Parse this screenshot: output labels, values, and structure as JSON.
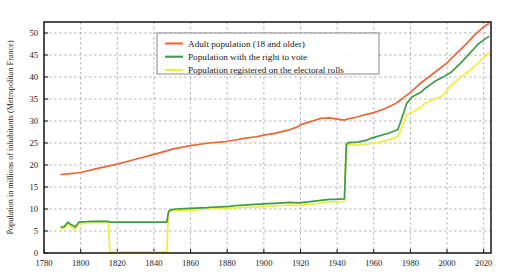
{
  "chart_data": {
    "type": "line",
    "title": "",
    "xlabel": "",
    "ylabel": "Population in millions of inhabitants (Metropolitan France)",
    "xlim": [
      1780,
      2024
    ],
    "ylim": [
      0,
      52.5
    ],
    "xticks": [
      1780,
      1800,
      1820,
      1840,
      1860,
      1880,
      1900,
      1920,
      1940,
      1960,
      1980,
      2000,
      2020
    ],
    "yticks": [
      0,
      5,
      10,
      15,
      20,
      25,
      30,
      35,
      40,
      45,
      50
    ],
    "grid": true,
    "legend_position": "upper-left-inside",
    "series": [
      {
        "name": "Adult population (18 and older)",
        "color": "#E8683A",
        "points": [
          [
            1789,
            17.8
          ],
          [
            1800,
            18.3
          ],
          [
            1810,
            19.3
          ],
          [
            1820,
            20.2
          ],
          [
            1830,
            21.3
          ],
          [
            1840,
            22.4
          ],
          [
            1846,
            23.1
          ],
          [
            1850,
            23.6
          ],
          [
            1860,
            24.4
          ],
          [
            1870,
            25.0
          ],
          [
            1876,
            25.2
          ],
          [
            1880,
            25.4
          ],
          [
            1886,
            25.8
          ],
          [
            1890,
            26.1
          ],
          [
            1896,
            26.4
          ],
          [
            1900,
            26.8
          ],
          [
            1906,
            27.2
          ],
          [
            1911,
            27.7
          ],
          [
            1914,
            28.0
          ],
          [
            1918,
            28.6
          ],
          [
            1921,
            29.3
          ],
          [
            1926,
            29.9
          ],
          [
            1931,
            30.6
          ],
          [
            1936,
            30.7
          ],
          [
            1939,
            30.5
          ],
          [
            1944,
            30.2
          ],
          [
            1946,
            30.5
          ],
          [
            1950,
            30.8
          ],
          [
            1954,
            31.3
          ],
          [
            1960,
            31.9
          ],
          [
            1965,
            32.6
          ],
          [
            1968,
            33.2
          ],
          [
            1972,
            34.0
          ],
          [
            1975,
            34.9
          ],
          [
            1980,
            36.5
          ],
          [
            1985,
            38.4
          ],
          [
            1990,
            40.0
          ],
          [
            1995,
            41.6
          ],
          [
            2000,
            43.2
          ],
          [
            2005,
            45.3
          ],
          [
            2010,
            47.3
          ],
          [
            2015,
            49.5
          ],
          [
            2020,
            51.4
          ],
          [
            2023,
            52.2
          ]
        ]
      },
      {
        "name": "Population with the right to vote",
        "color": "#3E9B46",
        "points": [
          [
            1789,
            5.8
          ],
          [
            1791,
            6.0
          ],
          [
            1793,
            7.0
          ],
          [
            1795,
            6.4
          ],
          [
            1797,
            5.9
          ],
          [
            1799,
            7.0
          ],
          [
            1802,
            7.1
          ],
          [
            1806,
            7.2
          ],
          [
            1810,
            7.2
          ],
          [
            1814,
            7.2
          ],
          [
            1815,
            7.2
          ],
          [
            1816,
            7.0
          ],
          [
            1820,
            7.0
          ],
          [
            1824,
            7.0
          ],
          [
            1830,
            7.0
          ],
          [
            1831,
            7.0
          ],
          [
            1840,
            7.0
          ],
          [
            1846,
            7.0
          ],
          [
            1847,
            7.0
          ],
          [
            1848,
            9.4
          ],
          [
            1849,
            9.8
          ],
          [
            1852,
            10.0
          ],
          [
            1857,
            10.1
          ],
          [
            1863,
            10.2
          ],
          [
            1869,
            10.3
          ],
          [
            1871,
            10.4
          ],
          [
            1876,
            10.5
          ],
          [
            1881,
            10.6
          ],
          [
            1885,
            10.8
          ],
          [
            1889,
            10.9
          ],
          [
            1893,
            11.0
          ],
          [
            1898,
            11.1
          ],
          [
            1902,
            11.2
          ],
          [
            1906,
            11.3
          ],
          [
            1910,
            11.4
          ],
          [
            1914,
            11.5
          ],
          [
            1919,
            11.4
          ],
          [
            1924,
            11.6
          ],
          [
            1928,
            11.8
          ],
          [
            1932,
            12.0
          ],
          [
            1936,
            12.2
          ],
          [
            1939,
            12.2
          ],
          [
            1944,
            12.3
          ],
          [
            1945,
            24.6
          ],
          [
            1946,
            25.1
          ],
          [
            1951,
            25.2
          ],
          [
            1956,
            25.6
          ],
          [
            1958,
            26.0
          ],
          [
            1962,
            26.5
          ],
          [
            1967,
            27.1
          ],
          [
            1968,
            27.2
          ],
          [
            1973,
            28.0
          ],
          [
            1974,
            29.0
          ],
          [
            1978,
            34.0
          ],
          [
            1981,
            35.5
          ],
          [
            1986,
            36.6
          ],
          [
            1988,
            37.4
          ],
          [
            1993,
            38.9
          ],
          [
            1995,
            39.4
          ],
          [
            1997,
            39.8
          ],
          [
            2002,
            41.0
          ],
          [
            2007,
            43.0
          ],
          [
            2012,
            45.2
          ],
          [
            2017,
            47.5
          ],
          [
            2022,
            49.0
          ],
          [
            2023,
            49.3
          ]
        ]
      },
      {
        "name": "Population registered on the electoral rolls",
        "color": "#F2ED3C",
        "points": [
          [
            1789,
            5.4
          ],
          [
            1791,
            5.6
          ],
          [
            1793,
            6.6
          ],
          [
            1795,
            5.8
          ],
          [
            1797,
            5.4
          ],
          [
            1799,
            6.6
          ],
          [
            1802,
            6.8
          ],
          [
            1806,
            6.9
          ],
          [
            1810,
            6.9
          ],
          [
            1814,
            6.9
          ],
          [
            1815,
            6.9
          ],
          [
            1816,
            0.2
          ],
          [
            1820,
            0.2
          ],
          [
            1824,
            0.2
          ],
          [
            1830,
            0.2
          ],
          [
            1831,
            0.2
          ],
          [
            1840,
            0.2
          ],
          [
            1846,
            0.2
          ],
          [
            1847,
            0.2
          ],
          [
            1848,
            9.4
          ],
          [
            1849,
            9.5
          ],
          [
            1852,
            9.7
          ],
          [
            1857,
            9.6
          ],
          [
            1863,
            9.8
          ],
          [
            1869,
            10.0
          ],
          [
            1871,
            10.1
          ],
          [
            1876,
            10.2
          ],
          [
            1881,
            10.2
          ],
          [
            1885,
            10.3
          ],
          [
            1889,
            10.4
          ],
          [
            1893,
            10.4
          ],
          [
            1898,
            10.5
          ],
          [
            1902,
            10.6
          ],
          [
            1906,
            10.7
          ],
          [
            1910,
            10.8
          ],
          [
            1914,
            10.9
          ],
          [
            1919,
            10.8
          ],
          [
            1924,
            11.0
          ],
          [
            1928,
            11.2
          ],
          [
            1932,
            11.4
          ],
          [
            1936,
            11.6
          ],
          [
            1939,
            11.6
          ],
          [
            1944,
            11.7
          ],
          [
            1945,
            23.6
          ],
          [
            1946,
            24.7
          ],
          [
            1951,
            24.5
          ],
          [
            1956,
            24.6
          ],
          [
            1958,
            24.9
          ],
          [
            1962,
            25.1
          ],
          [
            1967,
            25.6
          ],
          [
            1968,
            25.7
          ],
          [
            1973,
            26.5
          ],
          [
            1974,
            27.1
          ],
          [
            1978,
            31.3
          ],
          [
            1981,
            32.0
          ],
          [
            1986,
            33.2
          ],
          [
            1988,
            34.0
          ],
          [
            1993,
            35.0
          ],
          [
            1995,
            35.3
          ],
          [
            1997,
            35.6
          ],
          [
            2002,
            38.0
          ],
          [
            2007,
            39.8
          ],
          [
            2012,
            41.3
          ],
          [
            2017,
            43.2
          ],
          [
            2022,
            45.2
          ],
          [
            2023,
            45.5
          ]
        ]
      }
    ]
  }
}
